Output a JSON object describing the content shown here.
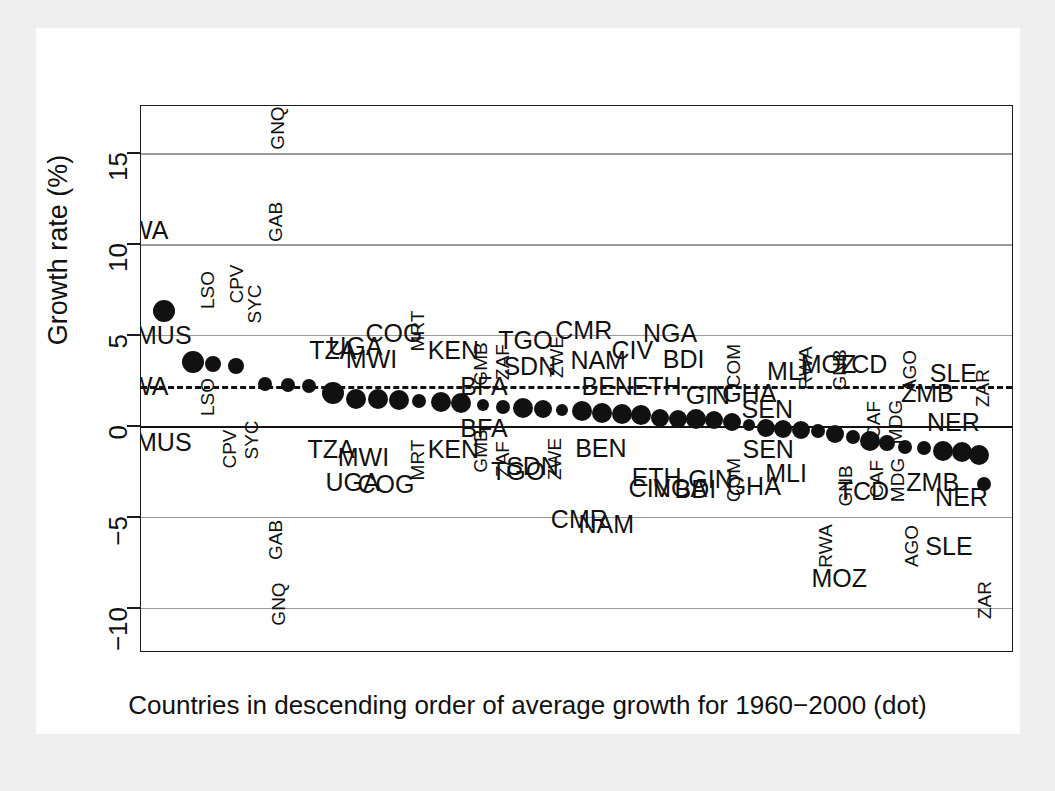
{
  "chart_data": {
    "type": "scatter",
    "title": "",
    "xlabel": "Countries in descending order of average growth for 1960−2000 (dot)",
    "ylabel": "Growth rate (%)",
    "ylim": [
      -12.5,
      17.6
    ],
    "yticks": [
      15,
      10,
      5,
      0,
      -5,
      -10
    ],
    "ytick_labels": [
      "15",
      "10",
      "5",
      "0",
      "−5",
      "−10"
    ],
    "grid": true,
    "reference_lines": [
      {
        "name": "zero-line",
        "value": 0,
        "style": "solid"
      },
      {
        "name": "mean-growth-line",
        "value": 2.2,
        "style": "dashed"
      }
    ],
    "series": [
      {
        "name": "Average growth 1960-2000 (dot)",
        "marker": "filled-circle",
        "points": [
          {
            "code": "MUS",
            "rank": 1,
            "dot": 6.3,
            "top": 10.8,
            "bottom": -0.9,
            "top_rot": false,
            "bottom_rot": false
          },
          {
            "code": "BWA",
            "rank": 1,
            "dot": null,
            "top": null,
            "bottom": null,
            "top_rot": false,
            "bottom_rot": false
          },
          {
            "code": "BWA",
            "rank": 2,
            "dot": 3.5,
            "top": 10.8,
            "bottom": 2.2,
            "top_rot": false,
            "bottom_rot": false
          },
          {
            "code": "LSO",
            "rank": 3,
            "dot": 3.4,
            "top": 7.4,
            "bottom": 1.6,
            "top_rot": true,
            "bottom_rot": true
          },
          {
            "code": "CPV",
            "rank": 4,
            "dot": 3.3,
            "top": 7.7,
            "bottom": -1.3,
            "top_rot": true,
            "bottom_rot": true
          },
          {
            "code": "SYC",
            "rank": 5,
            "dot": 2.3,
            "top": 6.8,
            "bottom": -0.8,
            "top_rot": true,
            "bottom_rot": true
          },
          {
            "code": "GNQ",
            "rank": 6,
            "dot": 2.2,
            "top": 16.5,
            "bottom": -9.8,
            "top_rot": true,
            "bottom_rot": true
          },
          {
            "code": "GAB",
            "rank": 7,
            "dot": 2.2,
            "top": 11.2,
            "bottom": -6.3,
            "top_rot": true,
            "bottom_rot": true
          },
          {
            "code": "TZA",
            "rank": 8,
            "dot": 1.8,
            "top": 4.1,
            "bottom": -1.3,
            "top_rot": false,
            "bottom_rot": false
          },
          {
            "code": "UGA",
            "rank": 9,
            "dot": 1.5,
            "top": 4.3,
            "bottom": -3.1,
            "top_rot": false,
            "bottom_rot": false
          },
          {
            "code": "MWI",
            "rank": 10,
            "dot": 1.4,
            "top": 3.8,
            "bottom": -1.6,
            "top_rot": false,
            "bottom_rot": false
          },
          {
            "code": "COG",
            "rank": 11,
            "dot": 1.4,
            "top": 5.0,
            "bottom": -3.2,
            "top_rot": false,
            "bottom_rot": false
          },
          {
            "code": "MRT",
            "rank": 12,
            "dot": 1.3,
            "top": 5.1,
            "bottom": -1.9,
            "top_rot": true,
            "bottom_rot": true
          },
          {
            "code": "BFA",
            "rank": 13,
            "dot": 1.3,
            "top": 2.2,
            "bottom": -0.1,
            "top_rot": false,
            "bottom_rot": false
          },
          {
            "code": "KEN",
            "rank": 14,
            "dot": 1.2,
            "top": 4.2,
            "bottom": -1.3,
            "top_rot": false,
            "bottom_rot": false
          },
          {
            "code": "GMB",
            "rank": 15,
            "dot": 1.0,
            "top": 3.4,
            "bottom": -1.4,
            "top_rot": true,
            "bottom_rot": true
          },
          {
            "code": "ZAF",
            "rank": 16,
            "dot": 1.0,
            "top": 3.5,
            "bottom": -1.8,
            "top_rot": true,
            "bottom_rot": true
          },
          {
            "code": "TGO",
            "rank": 17,
            "dot": 0.9,
            "top": 4.6,
            "bottom": -2.3,
            "top_rot": false,
            "bottom_rot": false
          },
          {
            "code": "SDN",
            "rank": 18,
            "dot": 0.9,
            "top": 3.4,
            "bottom": -2.2,
            "top_rot": false,
            "bottom_rot": false
          },
          {
            "code": "ZWE",
            "rank": 19,
            "dot": 0.8,
            "top": 3.9,
            "bottom": -1.8,
            "top_rot": true,
            "bottom_rot": true
          },
          {
            "code": "CMR",
            "rank": 20,
            "dot": 0.7,
            "top": 5.2,
            "bottom": -5.1,
            "top_rot": false,
            "bottom_rot": false
          },
          {
            "code": "NAM",
            "rank": 21,
            "dot": 0.6,
            "top": 3.6,
            "bottom": -5.4,
            "top_rot": false,
            "bottom_rot": false
          },
          {
            "code": "BEN",
            "rank": 22,
            "dot": 0.6,
            "top": 2.2,
            "bottom": -1.2,
            "top_rot": false,
            "bottom_rot": false
          },
          {
            "code": "CIV",
            "rank": 23,
            "dot": 0.5,
            "top": 4.2,
            "bottom": -3.4,
            "top_rot": false,
            "bottom_rot": false
          },
          {
            "code": "NGA",
            "rank": 24,
            "dot": 0.5,
            "top": 5.0,
            "bottom": -3.4,
            "top_rot": false,
            "bottom_rot": false
          },
          {
            "code": "ETH",
            "rank": 25,
            "dot": 0.4,
            "top": 2.2,
            "bottom": -2.8,
            "top_rot": false,
            "bottom_rot": false
          },
          {
            "code": "BDI",
            "rank": 26,
            "dot": 0.3,
            "top": 3.7,
            "bottom": -3.4,
            "top_rot": false,
            "bottom_rot": false
          },
          {
            "code": "GIN",
            "rank": 27,
            "dot": 0.2,
            "top": 2.2,
            "bottom": -2.9,
            "top_rot": false,
            "bottom_rot": false
          },
          {
            "code": "COM",
            "rank": 28,
            "dot": 0.1,
            "top": 3.3,
            "bottom": -3.0,
            "top_rot": true,
            "bottom_rot": true
          },
          {
            "code": "GHA",
            "rank": 29,
            "dot": 0.0,
            "top": 2.1,
            "bottom": -3.3,
            "top_rot": false,
            "bottom_rot": false
          },
          {
            "code": "SEN",
            "rank": 30,
            "dot": -0.1,
            "top": 1.0,
            "bottom": -1.3,
            "top_rot": false,
            "bottom_rot": false
          },
          {
            "code": "MLI",
            "rank": 31,
            "dot": -0.2,
            "top": 3.0,
            "bottom": -2.6,
            "top_rot": false,
            "bottom_rot": false
          },
          {
            "code": "RWA",
            "rank": 32,
            "dot": -0.3,
            "top": 3.2,
            "bottom": -6.6,
            "top_rot": true,
            "bottom_rot": true
          },
          {
            "code": "MOZ",
            "rank": 33,
            "dot": -0.4,
            "top": 3.4,
            "bottom": -8.4,
            "top_rot": false,
            "bottom_rot": false
          },
          {
            "code": "GNB",
            "rank": 34,
            "dot": -0.6,
            "top": 3.1,
            "bottom": -3.3,
            "top_rot": true,
            "bottom_rot": true
          },
          {
            "code": "TCD",
            "rank": 35,
            "dot": -0.7,
            "top": 3.4,
            "bottom": -3.5,
            "top_rot": false,
            "bottom_rot": false
          },
          {
            "code": "CAF",
            "rank": 36,
            "dot": -0.9,
            "top": 0.2,
            "bottom": -2.9,
            "top_rot": true,
            "bottom_rot": true
          },
          {
            "code": "MDG",
            "rank": 37,
            "dot": -1.1,
            "top": 0.1,
            "bottom": -3.0,
            "top_rot": true,
            "bottom_rot": true
          },
          {
            "code": "AGO",
            "rank": 38,
            "dot": -1.2,
            "top": 3.0,
            "bottom": -6.6,
            "top_rot": true,
            "bottom_rot": true
          },
          {
            "code": "ZMB",
            "rank": 39,
            "dot": -1.4,
            "top": 1.8,
            "bottom": -3.1,
            "top_rot": false,
            "bottom_rot": false
          },
          {
            "code": "SLE",
            "rank": 40,
            "dot": -1.4,
            "top": 2.9,
            "bottom": -6.6,
            "top_rot": false,
            "bottom_rot": false
          },
          {
            "code": "NER",
            "rank": 41,
            "dot": -1.5,
            "top": 0.1,
            "bottom": -3.9,
            "top_rot": false,
            "bottom_rot": false
          },
          {
            "code": "ZAR",
            "rank": 42,
            "dot": -3.2,
            "top": 2.2,
            "bottom": -9.6,
            "top_rot": true,
            "bottom_rot": true
          }
        ]
      }
    ]
  },
  "axis": {
    "y_title": "Growth rate (%)",
    "x_caption": "Countries in descending order of average growth for 1960−2000 (dot)",
    "tick_labels": [
      "15",
      "10",
      "5",
      "0",
      "−5",
      "−10"
    ]
  },
  "labels_above": [
    {
      "code": "BWA",
      "x": 4,
      "y": 10.8,
      "rot": false
    },
    {
      "code": "GNQ",
      "x": 156,
      "y": 16.4,
      "rot": true
    },
    {
      "code": "GAB",
      "x": 154,
      "y": 11.2,
      "rot": true
    },
    {
      "code": "LSO",
      "x": 78,
      "y": 7.5,
      "rot": true
    },
    {
      "code": "CPV",
      "x": 110,
      "y": 7.8,
      "rot": true
    },
    {
      "code": "SYC",
      "x": 130,
      "y": 6.7,
      "rot": true
    },
    {
      "code": "MUS",
      "x": 30,
      "y": 5.0,
      "rot": false
    },
    {
      "code": "TZA",
      "x": 218,
      "y": 4.2,
      "rot": false
    },
    {
      "code": "UGA",
      "x": 243,
      "y": 4.4,
      "rot": false
    },
    {
      "code": "MWI",
      "x": 261,
      "y": 3.7,
      "rot": false
    },
    {
      "code": "COG",
      "x": 286,
      "y": 5.1,
      "rot": false
    },
    {
      "code": "MRT",
      "x": 312,
      "y": 5.2,
      "rot": true
    },
    {
      "code": "KEN",
      "x": 352,
      "y": 4.2,
      "rot": false
    },
    {
      "code": "GMB",
      "x": 382,
      "y": 3.4,
      "rot": true
    },
    {
      "code": "ZAF",
      "x": 406,
      "y": 3.5,
      "rot": true
    },
    {
      "code": "TGO",
      "x": 432,
      "y": 4.7,
      "rot": false
    },
    {
      "code": "SDN",
      "x": 437,
      "y": 3.3,
      "rot": false
    },
    {
      "code": "ZWE",
      "x": 466,
      "y": 3.8,
      "rot": true
    },
    {
      "code": "CMR",
      "x": 497,
      "y": 5.3,
      "rot": false
    },
    {
      "code": "NAM",
      "x": 513,
      "y": 3.6,
      "rot": false
    },
    {
      "code": "CIV",
      "x": 551,
      "y": 4.2,
      "rot": false
    },
    {
      "code": "NGA",
      "x": 593,
      "y": 5.1,
      "rot": false
    },
    {
      "code": "BDI",
      "x": 608,
      "y": 3.7,
      "rot": false
    },
    {
      "code": "GIN",
      "x": 635,
      "y": 1.7,
      "rot": false
    },
    {
      "code": "COM",
      "x": 663,
      "y": 3.3,
      "rot": true
    },
    {
      "code": "GHA",
      "x": 681,
      "y": 1.8,
      "rot": false
    },
    {
      "code": "SEN",
      "x": 701,
      "y": 0.9,
      "rot": false
    },
    {
      "code": "MLI",
      "x": 724,
      "y": 3.0,
      "rot": false
    },
    {
      "code": "RWA",
      "x": 743,
      "y": 3.2,
      "rot": true
    },
    {
      "code": "MOZ",
      "x": 769,
      "y": 3.4,
      "rot": false
    },
    {
      "code": "GNB",
      "x": 781,
      "y": 3.1,
      "rot": true
    },
    {
      "code": "TCD",
      "x": 806,
      "y": 3.4,
      "rot": false
    },
    {
      "code": "CAF",
      "x": 819,
      "y": 0.3,
      "rot": true
    },
    {
      "code": "MDG",
      "x": 843,
      "y": 0.2,
      "rot": true
    },
    {
      "code": "AGO",
      "x": 859,
      "y": 3.0,
      "rot": true
    },
    {
      "code": "ZMB",
      "x": 879,
      "y": 1.8,
      "rot": false
    },
    {
      "code": "SLE",
      "x": 908,
      "y": 2.9,
      "rot": false
    },
    {
      "code": "NER",
      "x": 908,
      "y": 0.2,
      "rot": false
    },
    {
      "code": "ZAR",
      "x": 940,
      "y": 2.1,
      "rot": true
    },
    {
      "code": "BFA",
      "x": 386,
      "y": 2.2,
      "rot": false
    },
    {
      "code": "BEN",
      "x": 523,
      "y": 2.2,
      "rot": false
    },
    {
      "code": "ETH",
      "x": 578,
      "y": 2.2,
      "rot": false
    },
    {
      "code": "BWA2",
      "x": 4,
      "y": 2.2,
      "rot": false
    }
  ],
  "labels_below": [
    {
      "code": "MUS",
      "x": 30,
      "y": -0.9,
      "rot": false
    },
    {
      "code": "LSO",
      "x": 78,
      "y": 1.6,
      "rot": true
    },
    {
      "code": "CPV",
      "x": 103,
      "y": -1.3,
      "rot": true
    },
    {
      "code": "SYC",
      "x": 127,
      "y": -0.8,
      "rot": true
    },
    {
      "code": "GAB",
      "x": 154,
      "y": -6.3,
      "rot": true
    },
    {
      "code": "GNQ",
      "x": 157,
      "y": -9.8,
      "rot": true
    },
    {
      "code": "TZA",
      "x": 216,
      "y": -1.3,
      "rot": false
    },
    {
      "code": "MWI",
      "x": 252,
      "y": -1.7,
      "rot": false
    },
    {
      "code": "UGA",
      "x": 240,
      "y": -3.1,
      "rot": false
    },
    {
      "code": "COG",
      "x": 277,
      "y": -3.2,
      "rot": false
    },
    {
      "code": "MRT",
      "x": 312,
      "y": -1.9,
      "rot": true
    },
    {
      "code": "BFA",
      "x": 386,
      "y": -0.1,
      "rot": false
    },
    {
      "code": "KEN",
      "x": 352,
      "y": -1.3,
      "rot": false
    },
    {
      "code": "GMB",
      "x": 382,
      "y": -1.4,
      "rot": true
    },
    {
      "code": "ZAF",
      "x": 406,
      "y": -1.8,
      "rot": true
    },
    {
      "code": "TGO",
      "x": 424,
      "y": -2.5,
      "rot": false
    },
    {
      "code": "SDN",
      "x": 440,
      "y": -2.2,
      "rot": false
    },
    {
      "code": "ZWE",
      "x": 464,
      "y": -1.8,
      "rot": true
    },
    {
      "code": "BEN",
      "x": 516,
      "y": -1.2,
      "rot": false
    },
    {
      "code": "CMR",
      "x": 492,
      "y": -5.1,
      "rot": false
    },
    {
      "code": "NAM",
      "x": 522,
      "y": -5.4,
      "rot": false
    },
    {
      "code": "ETH",
      "x": 578,
      "y": -2.8,
      "rot": false
    },
    {
      "code": "CIV",
      "x": 570,
      "y": -3.4,
      "rot": false
    },
    {
      "code": "NGA",
      "x": 604,
      "y": -3.4,
      "rot": false
    },
    {
      "code": "BDI",
      "x": 621,
      "y": -3.5,
      "rot": false
    },
    {
      "code": "GIN",
      "x": 638,
      "y": -2.9,
      "rot": false
    },
    {
      "code": "COM",
      "x": 663,
      "y": -3.0,
      "rot": true
    },
    {
      "code": "GHA",
      "x": 686,
      "y": -3.3,
      "rot": false
    },
    {
      "code": "SEN",
      "x": 702,
      "y": -1.3,
      "rot": false
    },
    {
      "code": "MLI",
      "x": 722,
      "y": -2.6,
      "rot": false
    },
    {
      "code": "RWA",
      "x": 765,
      "y": -6.6,
      "rot": true
    },
    {
      "code": "MOZ",
      "x": 781,
      "y": -8.4,
      "rot": false
    },
    {
      "code": "GNB",
      "x": 787,
      "y": -3.3,
      "rot": true
    },
    {
      "code": "TCD",
      "x": 808,
      "y": -3.6,
      "rot": false
    },
    {
      "code": "CAF",
      "x": 822,
      "y": -2.9,
      "rot": true
    },
    {
      "code": "MDG",
      "x": 845,
      "y": -3.0,
      "rot": true
    },
    {
      "code": "AGO",
      "x": 861,
      "y": -6.6,
      "rot": true
    },
    {
      "code": "SLE",
      "x": 903,
      "y": -6.6,
      "rot": false
    },
    {
      "code": "ZMB",
      "x": 885,
      "y": -3.1,
      "rot": false
    },
    {
      "code": "NER",
      "x": 917,
      "y": -3.9,
      "rot": false
    },
    {
      "code": "ZAR",
      "x": 942,
      "y": -9.6,
      "rot": true
    }
  ],
  "dots": [
    {
      "x": 30,
      "y": 6.3,
      "r": 11
    },
    {
      "x": 62,
      "y": 3.5,
      "r": 11
    },
    {
      "x": 85,
      "y": 3.4,
      "r": 8
    },
    {
      "x": 110,
      "y": 3.3,
      "r": 8
    },
    {
      "x": 143,
      "y": 2.3,
      "r": 7
    },
    {
      "x": 168,
      "y": 2.25,
      "r": 7
    },
    {
      "x": 192,
      "y": 2.2,
      "r": 7
    },
    {
      "x": 218,
      "y": 1.8,
      "r": 11
    },
    {
      "x": 244,
      "y": 1.5,
      "r": 10
    },
    {
      "x": 268,
      "y": 1.45,
      "r": 10
    },
    {
      "x": 292,
      "y": 1.4,
      "r": 10
    },
    {
      "x": 314,
      "y": 1.35,
      "r": 7
    },
    {
      "x": 338,
      "y": 1.3,
      "r": 10
    },
    {
      "x": 361,
      "y": 1.25,
      "r": 10
    },
    {
      "x": 385,
      "y": 1.15,
      "r": 6
    },
    {
      "x": 407,
      "y": 1.05,
      "r": 7
    },
    {
      "x": 429,
      "y": 1.0,
      "r": 10
    },
    {
      "x": 452,
      "y": 0.95,
      "r": 9
    },
    {
      "x": 473,
      "y": 0.85,
      "r": 6
    },
    {
      "x": 495,
      "y": 0.8,
      "r": 10
    },
    {
      "x": 517,
      "y": 0.7,
      "r": 10
    },
    {
      "x": 539,
      "y": 0.65,
      "r": 10
    },
    {
      "x": 561,
      "y": 0.6,
      "r": 10
    },
    {
      "x": 582,
      "y": 0.45,
      "r": 9
    },
    {
      "x": 602,
      "y": 0.4,
      "r": 9
    },
    {
      "x": 622,
      "y": 0.35,
      "r": 10
    },
    {
      "x": 642,
      "y": 0.3,
      "r": 9
    },
    {
      "x": 662,
      "y": 0.2,
      "r": 9
    },
    {
      "x": 681,
      "y": 0.05,
      "r": 6
    },
    {
      "x": 700,
      "y": -0.1,
      "r": 9
    },
    {
      "x": 719,
      "y": -0.2,
      "r": 9
    },
    {
      "x": 738,
      "y": -0.25,
      "r": 9
    },
    {
      "x": 757,
      "y": -0.3,
      "r": 7
    },
    {
      "x": 776,
      "y": -0.45,
      "r": 9
    },
    {
      "x": 796,
      "y": -0.6,
      "r": 7
    },
    {
      "x": 815,
      "y": -0.85,
      "r": 10
    },
    {
      "x": 834,
      "y": -0.95,
      "r": 8
    },
    {
      "x": 854,
      "y": -1.15,
      "r": 7
    },
    {
      "x": 875,
      "y": -1.2,
      "r": 7
    },
    {
      "x": 896,
      "y": -1.4,
      "r": 10
    },
    {
      "x": 917,
      "y": -1.45,
      "r": 10
    },
    {
      "x": 936,
      "y": -1.6,
      "r": 10
    },
    {
      "x": 942,
      "y": -3.2,
      "r": 7
    }
  ]
}
